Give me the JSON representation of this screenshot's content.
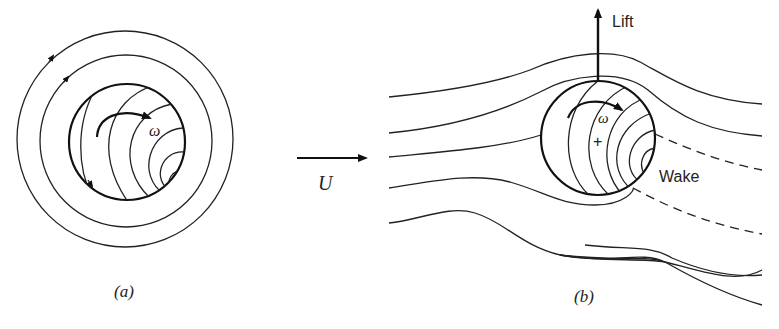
{
  "figure": {
    "panel_a": {
      "label": "(a)",
      "rotation_symbol": "ω",
      "description": "Rotating sphere in still fluid with circular streamlines"
    },
    "panel_b": {
      "label": "(b)",
      "rotation_symbol": "ω",
      "lift_label": "Lift",
      "wake_label": "Wake",
      "center_mark": "+",
      "description": "Rotating sphere in uniform flow producing lift (Magnus effect)"
    },
    "flow": {
      "velocity_label": "U"
    }
  }
}
